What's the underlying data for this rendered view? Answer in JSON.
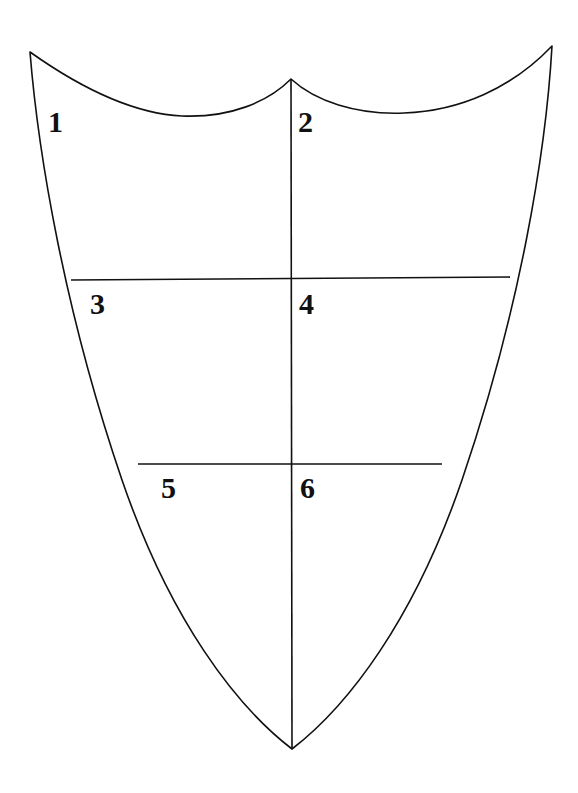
{
  "diagram": {
    "name": "shield-escutcheon-six-quarters",
    "background_color": "#ffffff",
    "stroke_color": "#111111",
    "stroke_width": 1.6,
    "fill_color": "none",
    "canvas": {
      "width": 578,
      "height": 793
    },
    "geometry": {
      "top_left_corner": [
        30,
        52
      ],
      "top_right_corner": [
        552,
        46
      ],
      "top_center_peak": [
        291,
        79
      ],
      "bottom_point": [
        292,
        749
      ],
      "left_dip_low_point": [
        182,
        116
      ],
      "right_dip_low_point": [
        404,
        113
      ],
      "fess_line_1": {
        "y_left": 280,
        "y_right": 277,
        "x_left": 71,
        "x_right": 510
      },
      "fess_line_2": {
        "y_left": 464,
        "y_right": 464,
        "x_left": 138,
        "x_right": 442
      },
      "pale_line": {
        "x": 291,
        "y_top": 79,
        "y_bottom": 749
      }
    },
    "sections": [
      {
        "id": "section-1",
        "label": "1",
        "x": 48,
        "y": 132
      },
      {
        "id": "section-2",
        "label": "2",
        "x": 298,
        "y": 132
      },
      {
        "id": "section-3",
        "label": "3",
        "x": 90,
        "y": 314
      },
      {
        "id": "section-4",
        "label": "4",
        "x": 299,
        "y": 314
      },
      {
        "id": "section-5",
        "label": "5",
        "x": 161,
        "y": 498
      },
      {
        "id": "section-6",
        "label": "6",
        "x": 300,
        "y": 498
      }
    ]
  }
}
